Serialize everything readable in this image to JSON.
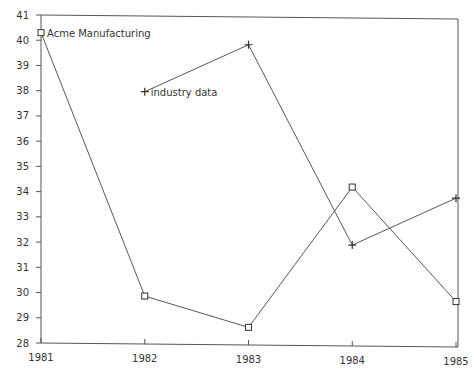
{
  "chart_data": {
    "type": "line",
    "title": "",
    "xlabel": "",
    "ylabel": "",
    "categories": [
      "1981",
      "1982",
      "1983",
      "1984",
      "1985"
    ],
    "ylim": [
      28,
      41
    ],
    "yticks": [
      "28",
      "29",
      "30",
      "31",
      "32",
      "33",
      "34",
      "35",
      "36",
      "37",
      "38",
      "39",
      "40",
      "41"
    ],
    "grid": false,
    "legend_position": "inline labels",
    "series": [
      {
        "name": "Acme Manufacturing",
        "marker": "square",
        "values": [
          40.3,
          29.9,
          28.7,
          34.3,
          29.8
        ]
      },
      {
        "name": "industry data",
        "marker": "plus",
        "values": [
          null,
          38.0,
          39.9,
          32.0,
          33.9
        ]
      }
    ]
  },
  "colors": {
    "line": "#444444",
    "frame": "#555555",
    "background": "#ffffff"
  }
}
